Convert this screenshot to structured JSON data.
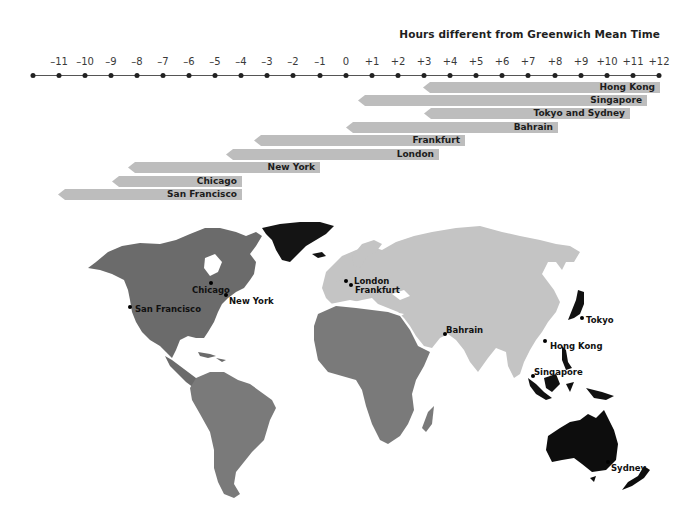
{
  "title": "Hours different from Greenwich Mean Time",
  "axis": {
    "ticks": [
      {
        "label": "",
        "x": 33
      },
      {
        "label": "–11",
        "x": 59
      },
      {
        "label": "–10",
        "x": 85
      },
      {
        "label": "–9",
        "x": 111
      },
      {
        "label": "–8",
        "x": 137
      },
      {
        "label": "–7",
        "x": 163
      },
      {
        "label": "–6",
        "x": 189
      },
      {
        "label": "–5",
        "x": 215
      },
      {
        "label": "–4",
        "x": 241
      },
      {
        "label": "–3",
        "x": 267
      },
      {
        "label": "–2",
        "x": 293
      },
      {
        "label": "–1",
        "x": 320
      },
      {
        "label": "0",
        "x": 346
      },
      {
        "label": "+1",
        "x": 372
      },
      {
        "label": "+2",
        "x": 398
      },
      {
        "label": "+3",
        "x": 424
      },
      {
        "label": "+4",
        "x": 450
      },
      {
        "label": "+5",
        "x": 476
      },
      {
        "label": "+6",
        "x": 502
      },
      {
        "label": "+7",
        "x": 528
      },
      {
        "label": "+8",
        "x": 555
      },
      {
        "label": "+9",
        "x": 581
      },
      {
        "label": "+10",
        "x": 607
      },
      {
        "label": "+11",
        "x": 633
      },
      {
        "label": "+12",
        "x": 659
      }
    ]
  },
  "bars": [
    {
      "label": "Hong Kong",
      "left": 423,
      "right": 660,
      "top": 82
    },
    {
      "label": "Singapore",
      "left": 358,
      "right": 647,
      "top": 95
    },
    {
      "label": "Tokyo and Sydney",
      "left": 424,
      "right": 630,
      "top": 108
    },
    {
      "label": "Bahrain",
      "left": 346,
      "right": 558,
      "top": 122
    },
    {
      "label": "Frankfurt",
      "left": 254,
      "right": 465,
      "top": 135
    },
    {
      "label": "London",
      "left": 226,
      "right": 439,
      "top": 149
    },
    {
      "label": "New York",
      "left": 128,
      "right": 320,
      "top": 162
    },
    {
      "label": "Chicago",
      "left": 112,
      "right": 242,
      "top": 176
    },
    {
      "label": "San Francisco",
      "left": 58,
      "right": 242,
      "top": 189
    }
  ],
  "cities": [
    {
      "name": "Chicago",
      "dot": [
        211,
        283
      ],
      "label": [
        192,
        285
      ]
    },
    {
      "name": "New York",
      "dot": [
        226,
        295
      ],
      "label": [
        229,
        296
      ]
    },
    {
      "name": "San Francisco",
      "dot": [
        130,
        307
      ],
      "label": [
        135,
        304
      ]
    },
    {
      "name": "London",
      "dot": [
        346,
        281
      ],
      "label": [
        354,
        276
      ]
    },
    {
      "name": "Frankfurt",
      "dot": [
        351,
        285
      ],
      "label": [
        355,
        285
      ]
    },
    {
      "name": "Bahrain",
      "dot": [
        445,
        334
      ],
      "label": [
        446,
        325
      ]
    },
    {
      "name": "Tokyo",
      "dot": [
        582,
        318
      ],
      "label": [
        586,
        315
      ]
    },
    {
      "name": "Hong Kong",
      "dot": [
        545,
        341
      ],
      "label": [
        550,
        341
      ]
    },
    {
      "name": "Singapore",
      "dot": [
        533,
        376
      ],
      "label": [
        534,
        367
      ]
    },
    {
      "name": "Sydney",
      "dot": [
        608,
        462
      ],
      "label": [
        611,
        463
      ]
    }
  ],
  "chart_data": {
    "type": "bar",
    "title": "Hours different from Greenwich Mean Time",
    "xlabel": "Hours different from Greenwich Mean Time",
    "xlim": [
      -12,
      12
    ],
    "categories": [
      "Hong Kong",
      "Singapore",
      "Tokyo and Sydney",
      "Bahrain",
      "Frankfurt",
      "London",
      "New York",
      "Chicago",
      "San Francisco"
    ],
    "series": [
      {
        "name": "Range start (hours vs GMT)",
        "values": [
          3,
          0.5,
          3,
          0,
          -3.5,
          -4.5,
          -8.3,
          -8.9,
          -11
        ]
      },
      {
        "name": "Range end (hours vs GMT)",
        "values": [
          12,
          11.5,
          10.8,
          8,
          4.5,
          3.5,
          -1,
          -4,
          -4
        ]
      }
    ],
    "legend": "none",
    "map_regions": {
      "Americas": "#6e6e6e",
      "Greenland": "#1a1a1a",
      "Europe_Asia": "#c4c4c4",
      "Africa": "#7a7a7a",
      "Japan_Indonesia_Australia_NZ": "#0d0d0d"
    }
  }
}
